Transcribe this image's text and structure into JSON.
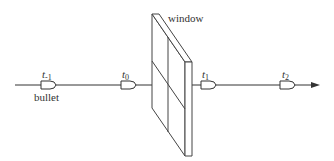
{
  "diagram": {
    "window_label": "window",
    "bullet_label": "bullet",
    "time_labels": [
      {
        "base": "t",
        "sub": "-1"
      },
      {
        "base": "t",
        "sub": "0"
      },
      {
        "base": "t",
        "sub": "1"
      },
      {
        "base": "t",
        "sub": "2"
      }
    ],
    "colors": {
      "stroke": "#333333",
      "background": "#ffffff"
    }
  }
}
